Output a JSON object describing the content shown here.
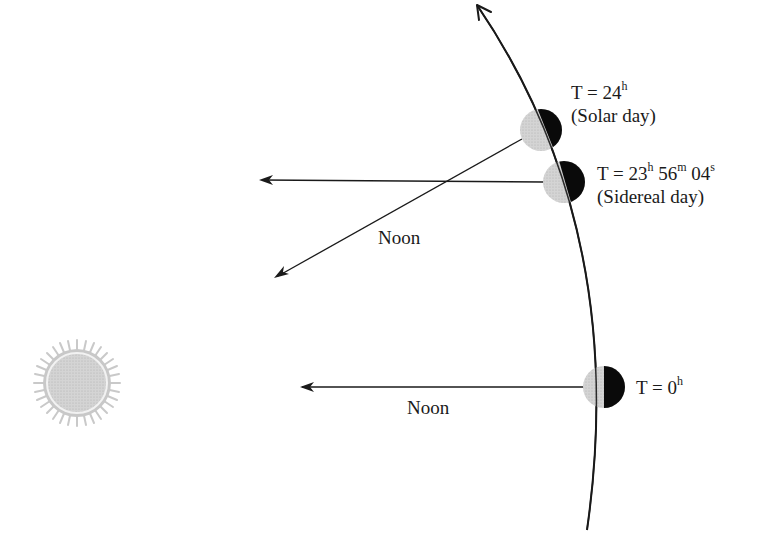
{
  "diagram": {
    "colors": {
      "orbit": "#1a1a1a",
      "day_side": "#c8c8c8",
      "night_side": "#0a0a0a",
      "sun": "#d0d0d0",
      "text": "#1a1a1a"
    },
    "orbit_arrow": "counter-clockwise",
    "earths": [
      {
        "id": "t0",
        "label_main": "T = 0",
        "label_sup_h": "h",
        "cx": 604,
        "cy": 387,
        "r": 21
      },
      {
        "id": "sidereal",
        "label_parts": [
          "T = 23",
          "h",
          " 56",
          "m",
          " 04",
          "s"
        ],
        "caption": "(Sidereal day)",
        "cx": 564,
        "cy": 182,
        "r": 21
      },
      {
        "id": "solar",
        "label_main": "T = 24",
        "label_sup_h": "h",
        "caption": "(Solar day)",
        "cx": 541,
        "cy": 130,
        "r": 21
      }
    ],
    "noon_arrows": [
      {
        "label": "Noon",
        "from": "T = 0h",
        "direction": "toward sun"
      },
      {
        "label": "Noon",
        "from": "T = 24h",
        "direction": "toward sun"
      }
    ],
    "parallel_arrow": {
      "from": "T = 23h 56m 04s",
      "direction": "parallel to initial noon line (distant star)"
    },
    "sun": {
      "label": "",
      "cx": 77,
      "cy": 383
    }
  }
}
